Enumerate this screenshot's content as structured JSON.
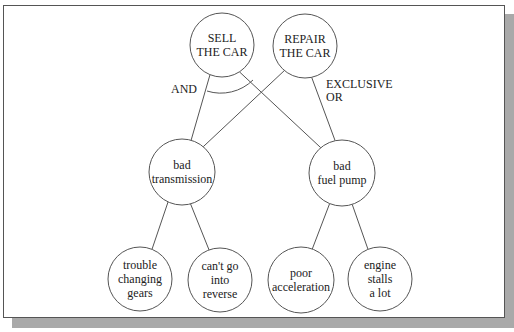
{
  "diagram": {
    "nodes": [
      {
        "id": "sell",
        "lines": [
          "SELL",
          "THE CAR"
        ],
        "level": "goal"
      },
      {
        "id": "repair",
        "lines": [
          "REPAIR",
          "THE CAR"
        ],
        "level": "goal"
      },
      {
        "id": "transmission",
        "lines": [
          "bad",
          "transmission"
        ],
        "level": "fault"
      },
      {
        "id": "fuelpump",
        "lines": [
          "bad",
          "fuel pump"
        ],
        "level": "fault"
      },
      {
        "id": "gears",
        "lines": [
          "trouble",
          "changing",
          "gears"
        ],
        "level": "symptom"
      },
      {
        "id": "reverse",
        "lines": [
          "can't go",
          "into",
          "reverse"
        ],
        "level": "symptom"
      },
      {
        "id": "accel",
        "lines": [
          "poor",
          "acceleration"
        ],
        "level": "symptom"
      },
      {
        "id": "stalls",
        "lines": [
          "engine",
          "stalls",
          "a lot"
        ],
        "level": "symptom"
      }
    ],
    "edges": [
      {
        "from": "sell",
        "to": "transmission"
      },
      {
        "from": "sell",
        "to": "fuelpump"
      },
      {
        "from": "repair",
        "to": "transmission"
      },
      {
        "from": "repair",
        "to": "fuelpump"
      },
      {
        "from": "transmission",
        "to": "gears"
      },
      {
        "from": "transmission",
        "to": "reverse"
      },
      {
        "from": "fuelpump",
        "to": "accel"
      },
      {
        "from": "fuelpump",
        "to": "stalls"
      }
    ],
    "annotations": {
      "and_label": "AND",
      "xor_label_line1": "EXCLUSIVE",
      "xor_label_line2": "OR"
    }
  }
}
